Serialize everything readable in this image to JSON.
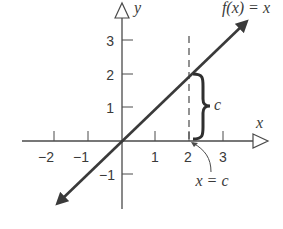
{
  "diagram": {
    "type": "function-graph",
    "function_label": "f(x) = x",
    "axes": {
      "x_label": "x",
      "y_label": "y",
      "x_ticks": [
        "−2",
        "−1",
        "1",
        "2",
        "3"
      ],
      "y_ticks": [
        "3",
        "2",
        "1",
        "−1"
      ]
    },
    "annotations": {
      "brace_label": "c",
      "vertical_line_label": "x = c",
      "vertical_line_x": 2
    },
    "colors": {
      "line": "#3a3a3a",
      "axis": "#4a4a4a",
      "background": "#ffffff"
    }
  }
}
